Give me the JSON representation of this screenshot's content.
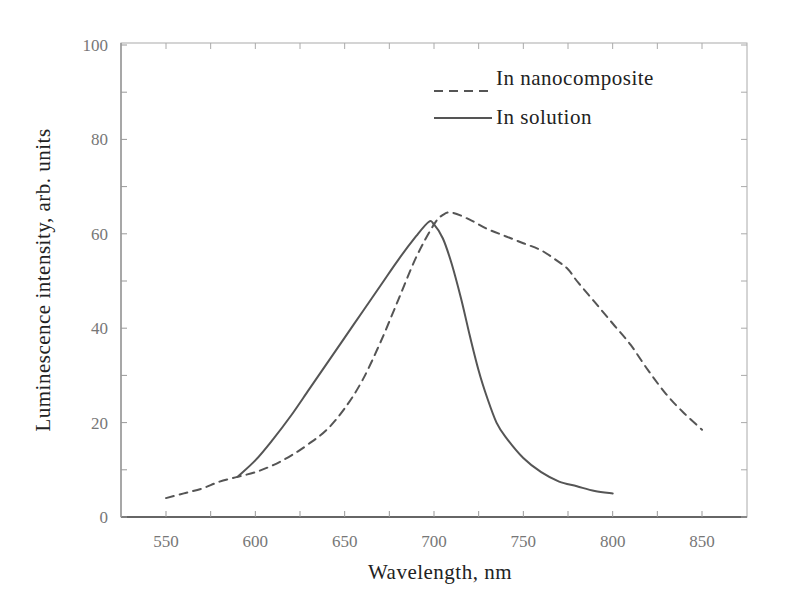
{
  "chart_data": {
    "type": "line",
    "title": "",
    "xlabel": "Wavelength, nm",
    "ylabel": "Luminescence intensity, arb. units",
    "xlim": [
      530,
      875
    ],
    "ylim": [
      0,
      100
    ],
    "xticks": [
      550,
      600,
      650,
      700,
      750,
      800,
      850
    ],
    "yticks": [
      0,
      20,
      40,
      60,
      80,
      100
    ],
    "grid": false,
    "legend_position": "upper right",
    "series": [
      {
        "name": "In nanocomposite",
        "style": "dashed",
        "color": "#555555",
        "x": [
          550,
          560,
          570,
          580,
          590,
          600,
          610,
          620,
          630,
          640,
          650,
          660,
          670,
          680,
          690,
          700,
          705,
          710,
          720,
          730,
          740,
          750,
          760,
          770,
          775,
          780,
          790,
          800,
          810,
          820,
          830,
          840,
          850
        ],
        "y": [
          4,
          5,
          6,
          7.5,
          8.5,
          9.5,
          11,
          13,
          15.5,
          18.5,
          23,
          29,
          37,
          46,
          55,
          62,
          64,
          64.5,
          63,
          61,
          59.5,
          58,
          56.5,
          54,
          52.5,
          50,
          45.5,
          41,
          36.5,
          31,
          26,
          22,
          18.5
        ]
      },
      {
        "name": "In solution",
        "style": "solid",
        "color": "#555555",
        "x": [
          590,
          600,
          610,
          620,
          630,
          640,
          650,
          660,
          670,
          680,
          690,
          697,
          700,
          705,
          710,
          715,
          720,
          725,
          730,
          735,
          740,
          750,
          760,
          770,
          780,
          790,
          800
        ],
        "y": [
          8.5,
          12,
          16.5,
          21.5,
          27,
          32.5,
          38,
          43.5,
          49,
          54.5,
          59.5,
          62.5,
          62,
          59,
          53.5,
          46.5,
          38.5,
          31,
          25,
          20,
          17,
          12.5,
          9.5,
          7.5,
          6.5,
          5.5,
          5
        ]
      }
    ]
  },
  "legend": {
    "items": [
      {
        "label": "In nanocomposite",
        "style": "dashed"
      },
      {
        "label": "In solution",
        "style": "solid"
      }
    ]
  },
  "colors": {
    "axis": "#999999",
    "line": "#555555",
    "text": "#222222",
    "tick_text": "#777777"
  }
}
